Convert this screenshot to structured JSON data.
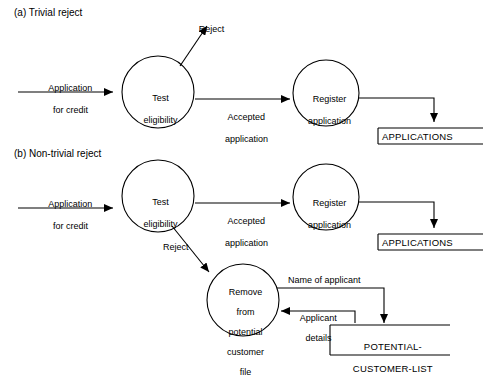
{
  "figure": {
    "sections": [
      {
        "id": "a",
        "caption": "(a) Trivial reject"
      },
      {
        "id": "b",
        "caption": "(b) Non-trivial reject"
      }
    ]
  },
  "diagram_a": {
    "processes": [
      {
        "name": "test-eligibility",
        "line1": "Test",
        "line2": "eligibility"
      },
      {
        "name": "register-application",
        "line1": "Register",
        "line2": "application"
      }
    ],
    "flows": [
      {
        "name": "application-for-credit",
        "line1": "Application",
        "line2": "for credit"
      },
      {
        "name": "reject",
        "line1": "Reject"
      },
      {
        "name": "accepted-application",
        "line1": "Accepted",
        "line2": "application"
      }
    ],
    "stores": [
      {
        "name": "applications-store",
        "label": "APPLICATIONS"
      }
    ]
  },
  "diagram_b": {
    "processes": [
      {
        "name": "test-eligibility",
        "line1": "Test",
        "line2": "eligibility"
      },
      {
        "name": "register-application",
        "line1": "Register",
        "line2": "application"
      },
      {
        "name": "remove-from-potential-customer-file",
        "line1": "Remove",
        "line2": "from",
        "line3": "potential",
        "line4": "customer",
        "line5": "file"
      }
    ],
    "flows": [
      {
        "name": "application-for-credit",
        "line1": "Application",
        "line2": "for credit"
      },
      {
        "name": "accepted-application",
        "line1": "Accepted",
        "line2": "application"
      },
      {
        "name": "reject",
        "line1": "Reject"
      },
      {
        "name": "name-of-applicant",
        "line1": "Name of applicant"
      },
      {
        "name": "applicant-details",
        "line1": "Applicant",
        "line2": "details"
      }
    ],
    "stores": [
      {
        "name": "applications-store",
        "label": "APPLICATIONS"
      },
      {
        "name": "potential-customer-list-store",
        "line1": "POTENTIAL-",
        "line2": "CUSTOMER-LIST"
      }
    ]
  }
}
